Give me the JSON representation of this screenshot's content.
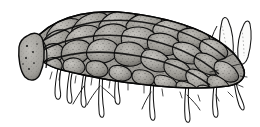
{
  "image": {
    "kind": "line-illustration",
    "subject_label": "Bagworm larva in case",
    "style": "black-and-white stippled pen-and-ink scientific illustration",
    "orientation": "left-facing head opening, right-facing tail with spines",
    "width": 260,
    "height": 127
  },
  "colors": {
    "background": "#ffffff",
    "ink": "#111111",
    "outline": "#000000",
    "scale_fill_light": "#b4b2ad",
    "scale_fill_mid": "#969490",
    "scale_fill_dark": "#6e6c68",
    "disc_fill": "#a7a5a0",
    "stipple": "#2b2b2b",
    "leg_fill": "#ffffff",
    "spine_fill": "#fbfbfa"
  },
  "parts": [
    {
      "id": "case-body",
      "label": "Scaled case body",
      "description": "Elongated curved case covered with overlapping teardrop scales"
    },
    {
      "id": "head-opening",
      "label": "Anterior case opening",
      "description": "Oval cut disc at left end with dark speckles"
    },
    {
      "id": "scale-rows",
      "label": "Overlapping plant scales",
      "description": "Diagonal rows of stippled gray scales"
    },
    {
      "id": "legs",
      "label": "Thoracic legs and prolegs",
      "description": "Slender white outlined legs hanging beneath the case"
    },
    {
      "id": "tail-spines",
      "label": "Posterior spines",
      "description": "Two pale pointed leaf-like projections at the upper right"
    },
    {
      "id": "bristles",
      "label": "Bristles",
      "description": "Fine dark hairs along lower and rear margins"
    }
  ],
  "geometry": {
    "body_top_y": 12,
    "body_bottom_y": 88,
    "body_left_x": 16,
    "body_right_x": 248,
    "legs_bottom_y": 118,
    "spine_top_y": 14,
    "scale_count": 64,
    "leg_count": 9
  },
  "caption": ""
}
